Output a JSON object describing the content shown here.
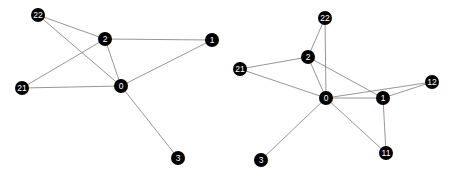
{
  "figure": {
    "title": "",
    "background_color": "#ffffff",
    "node_color": "#000000",
    "node_label_color": "#ffffff",
    "edge_color": "#8a8a8a",
    "node_radius": 7,
    "panel_count": 2
  },
  "graphs": [
    {
      "name": "left-graph",
      "node_count": 6,
      "edge_count": 8,
      "nodes": [
        {
          "id": "22",
          "label": "22",
          "x": 38,
          "y": 15
        },
        {
          "id": "2",
          "label": "2",
          "x": 105,
          "y": 39
        },
        {
          "id": "1",
          "label": "1",
          "x": 212,
          "y": 40
        },
        {
          "id": "21",
          "label": "21",
          "x": 22,
          "y": 88
        },
        {
          "id": "0",
          "label": "0",
          "x": 121,
          "y": 86
        },
        {
          "id": "3",
          "label": "3",
          "x": 178,
          "y": 158
        }
      ],
      "edges": [
        {
          "source": "22",
          "target": "2"
        },
        {
          "source": "22",
          "target": "0"
        },
        {
          "source": "21",
          "target": "2"
        },
        {
          "source": "21",
          "target": "0"
        },
        {
          "source": "2",
          "target": "0"
        },
        {
          "source": "2",
          "target": "1"
        },
        {
          "source": "0",
          "target": "1"
        },
        {
          "source": "0",
          "target": "3"
        }
      ]
    },
    {
      "name": "right-graph",
      "node_count": 8,
      "edge_count": 12,
      "nodes": [
        {
          "id": "22",
          "label": "22",
          "x": 325,
          "y": 18
        },
        {
          "id": "2",
          "label": "2",
          "x": 308,
          "y": 57
        },
        {
          "id": "21",
          "label": "21",
          "x": 240,
          "y": 69
        },
        {
          "id": "12",
          "label": "12",
          "x": 432,
          "y": 82
        },
        {
          "id": "0",
          "label": "0",
          "x": 326,
          "y": 98
        },
        {
          "id": "1",
          "label": "1",
          "x": 383,
          "y": 98
        },
        {
          "id": "11",
          "label": "11",
          "x": 386,
          "y": 153
        },
        {
          "id": "3",
          "label": "3",
          "x": 261,
          "y": 160
        }
      ],
      "edges": [
        {
          "source": "22",
          "target": "2"
        },
        {
          "source": "22",
          "target": "0"
        },
        {
          "source": "2",
          "target": "21"
        },
        {
          "source": "2",
          "target": "0"
        },
        {
          "source": "2",
          "target": "1"
        },
        {
          "source": "21",
          "target": "0"
        },
        {
          "source": "0",
          "target": "1"
        },
        {
          "source": "0",
          "target": "12"
        },
        {
          "source": "0",
          "target": "11"
        },
        {
          "source": "0",
          "target": "3"
        },
        {
          "source": "1",
          "target": "12"
        },
        {
          "source": "1",
          "target": "11"
        }
      ]
    }
  ]
}
